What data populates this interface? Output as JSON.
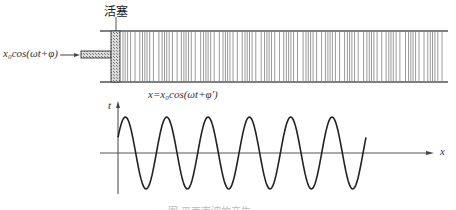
{
  "diagram": {
    "piston_label": "活塞",
    "input_label": "x₀cos(ωt+φ)",
    "wave_label": "x=x₀cos(ωt+φ′)",
    "axis_t_label": "t",
    "axis_x_label": "x",
    "caption": "图 平面声波的产生",
    "colors": {
      "line": "#444444",
      "hatch": "#888888",
      "stripe": "#9a9a9a",
      "wave": "#222222"
    },
    "wave": {
      "cycles": 6,
      "start_x": 118,
      "end_x": 366,
      "axis_y": 153
    }
  }
}
